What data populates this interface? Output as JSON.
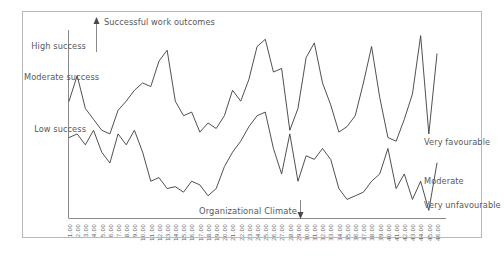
{
  "figure": {
    "background": "#ffffff",
    "frame_color": "#b9b9b9",
    "axis_color": "#8a8a8a",
    "line_color": "#3c3c3c",
    "text_color": "#58585a"
  },
  "annotations": {
    "top": {
      "text": "Successful work outcomes",
      "icon": "arrow-up-icon",
      "direction": "up"
    },
    "bottom": {
      "text": "Organizational Climate",
      "icon": "arrow-down-icon",
      "direction": "down"
    }
  },
  "y_axis_left": {
    "labels": [
      {
        "text": "High success"
      },
      {
        "text": "Moderate success"
      },
      {
        "text": "Low success"
      }
    ]
  },
  "y_axis_right": {
    "labels": [
      {
        "text": "Very favourable"
      },
      {
        "text": "Moderate"
      },
      {
        "text": "Very unfavourable"
      }
    ]
  },
  "chart_data": {
    "type": "line",
    "title": "",
    "xlabel": "Organizational Climate",
    "ylabel": "Successful work outcomes",
    "grid": false,
    "legend": "none",
    "ylim": [
      0,
      100
    ],
    "xlim": [
      0,
      45
    ],
    "categories": [
      "1.00",
      "2.00",
      "3.00",
      "4.00",
      "5.00",
      "6.00",
      "7.00",
      "8.00",
      "9.00",
      "10.00",
      "11.00",
      "12.00",
      "13.00",
      "14.00",
      "15.00",
      "16.00",
      "17.00",
      "18.00",
      "19.00",
      "20.00",
      "21.00",
      "22.00",
      "23.00",
      "24.00",
      "25.00",
      "26.00",
      "27.00",
      "28.00",
      "29.00",
      "30.00",
      "31.00",
      "32.00",
      "33.00",
      "34.00",
      "35.00",
      "36.00",
      "37.00",
      "38.00",
      "39.00",
      "40.00",
      "41.00",
      "42.00",
      "43.00",
      "44.00",
      "45.00",
      "46.00"
    ],
    "series": [
      {
        "name": "Successful work outcomes",
        "color": "#3c3c3c",
        "values": [
          62,
          76,
          58,
          52,
          46,
          44,
          57,
          62,
          68,
          72,
          70,
          84,
          90,
          62,
          54,
          56,
          45,
          50,
          47,
          54,
          68,
          62,
          74,
          92,
          96,
          78,
          80,
          46,
          58,
          86,
          94,
          72,
          60,
          45,
          48,
          54,
          72,
          92,
          64,
          42,
          40,
          52,
          66,
          98,
          44,
          88
        ]
      },
      {
        "name": "Organizational Climate",
        "color": "#3c3c3c",
        "values": [
          42,
          44,
          38,
          46,
          34,
          28,
          44,
          38,
          46,
          34,
          18,
          20,
          14,
          15,
          12,
          18,
          16,
          10,
          14,
          26,
          34,
          40,
          48,
          54,
          56,
          36,
          22,
          44,
          18,
          32,
          30,
          36,
          30,
          14,
          8,
          10,
          12,
          18,
          22,
          36,
          14,
          22,
          8,
          18,
          2,
          28
        ]
      }
    ]
  },
  "x_tick_labels": [
    "1.00",
    "2.00",
    "3.00",
    "4.00",
    "5.00",
    "6.00",
    "7.00",
    "8.00",
    "9.00",
    "10.00",
    "11.00",
    "12.00",
    "13.00",
    "14.00",
    "15.00",
    "16.00",
    "17.00",
    "18.00",
    "19.00",
    "20.00",
    "21.00",
    "22.00",
    "23.00",
    "24.00",
    "25.00",
    "26.00",
    "27.00",
    "28.00",
    "29.00",
    "30.00",
    "31.00",
    "32.00",
    "33.00",
    "34.00",
    "35.00",
    "36.00",
    "37.00",
    "38.00",
    "39.00",
    "40.00",
    "41.00",
    "42.00",
    "43.00",
    "44.00",
    "45.00",
    "46.00"
  ]
}
